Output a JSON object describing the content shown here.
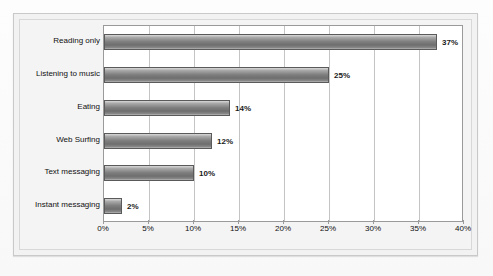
{
  "chart_data": {
    "type": "bar",
    "orientation": "horizontal",
    "title": "",
    "subtitle": "",
    "xlabel": "",
    "ylabel": "",
    "categories": [
      "Reading only",
      "Listening to music",
      "Eating",
      "Web Surfing",
      "Text messaging",
      "Instant messaging"
    ],
    "values": [
      37,
      25,
      14,
      12,
      10,
      2
    ],
    "data_labels": [
      "37%",
      "25%",
      "14%",
      "12%",
      "10%",
      "2%"
    ],
    "xlim": [
      0,
      40
    ],
    "xtick_values": [
      0,
      5,
      10,
      15,
      20,
      25,
      30,
      35,
      40
    ],
    "xtick_labels": [
      "0%",
      "5%",
      "10%",
      "15%",
      "20%",
      "25%",
      "30%",
      "35%",
      "40%"
    ],
    "grid": "vertical",
    "legend": "none",
    "bar_color": "#7e7e7e",
    "bar_border_color": "#5a5a5a",
    "plot_background": "#ffffff",
    "chart_background": "#f2f2f2",
    "gridline_color": "#c4c4c4",
    "axis_color": "#9a9a9a",
    "label_color": "#111111"
  }
}
